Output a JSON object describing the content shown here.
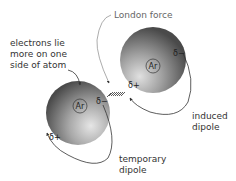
{
  "diagram": {
    "labels": {
      "london_force": "London force",
      "electrons_line1": "electrons lie",
      "electrons_line2": "more on one",
      "electrons_line3": "side of atom",
      "induced_line1": "induced",
      "induced_line2": "dipole",
      "temporary_line1": "temporary",
      "temporary_line2": "dipole"
    },
    "atoms": [
      {
        "id": "left",
        "symbol": "Ar",
        "delta_pos": "δ+",
        "delta_neg": "δ−",
        "role": "temporary dipole"
      },
      {
        "id": "right",
        "symbol": "Ar",
        "delta_pos": "δ+",
        "delta_neg": "δ−",
        "role": "induced dipole"
      }
    ],
    "colors": {
      "sphere_light": "#d8d8d8",
      "sphere_dark": "#5a5a5a",
      "line": "#333333",
      "text": "#333333"
    }
  }
}
